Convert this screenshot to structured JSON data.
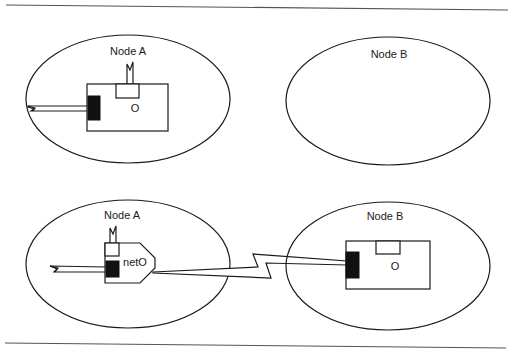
{
  "diagram": {
    "type": "node-migration-illustration",
    "colors": {
      "ink": "#1a1a1a",
      "block": "#111111",
      "rule": "#555555",
      "background": "#ffffff"
    },
    "top_panel": {
      "node_a": {
        "label": "Node A",
        "object_label": "O",
        "components": [
          "antenna-icon",
          "port-box",
          "attachment-block",
          "incoming-wire"
        ]
      },
      "node_b": {
        "label": "Node B",
        "components": []
      }
    },
    "bottom_panel": {
      "node_a": {
        "label": "Node A",
        "proxy_label": "netO",
        "components": [
          "antenna-icon",
          "port-box",
          "attachment-block",
          "incoming-wire",
          "proxy-pentagon"
        ]
      },
      "node_b": {
        "label": "Node B",
        "object_label": "O",
        "components": [
          "port-box",
          "attachment-block"
        ]
      },
      "link": {
        "type": "lightning-bolt",
        "from": "netO",
        "to": "Node B object"
      }
    }
  }
}
